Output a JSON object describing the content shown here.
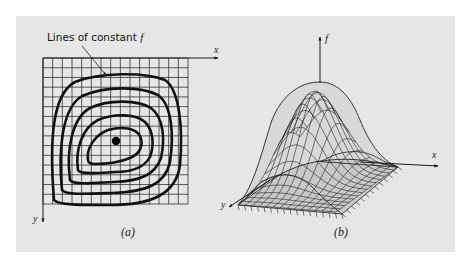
{
  "figure": {
    "background_color": "#e6e6e6",
    "page_color": "#ffffff",
    "ink_color": "#1a1a1a",
    "surface_fill": "#c8c8c8"
  },
  "panel_a": {
    "caption": "(a)",
    "callout_label": "Lines of constant ",
    "callout_var": "f",
    "x_axis_label": "x",
    "y_axis_label": "y",
    "grid": {
      "columns": 15,
      "rows": 15
    },
    "contour_count": 5,
    "optimum_marker": "filled-dot"
  },
  "panel_b": {
    "caption": "(b)",
    "f_axis_label": "f",
    "x_axis_label": "x",
    "y_axis_label": "y"
  }
}
